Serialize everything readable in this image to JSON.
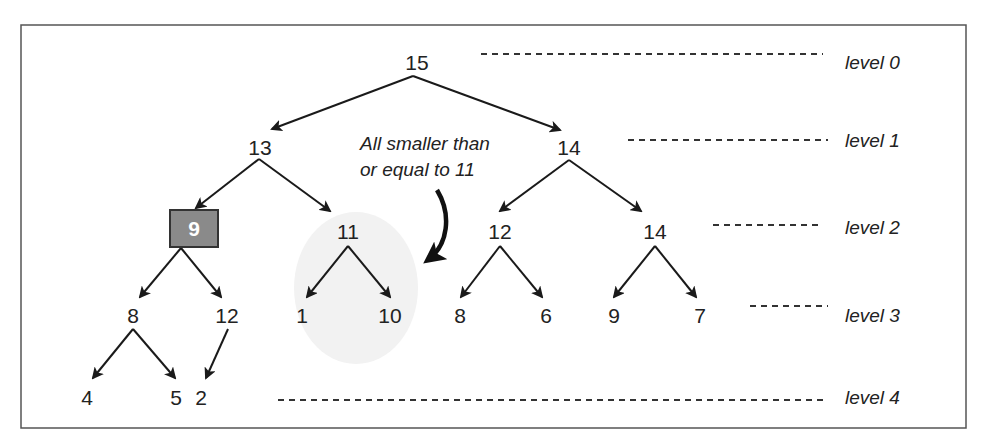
{
  "diagram": {
    "type": "max-heap-tree",
    "frame": {
      "x": 21,
      "y": 25,
      "w": 945,
      "h": 403,
      "border": "#555555"
    },
    "colors": {
      "edge": "#1a1a1a",
      "highlight_fill": "#8a8a8a",
      "highlight_border": "#333333",
      "highlight_text": "#ffffff",
      "cloud": "#f2f2f2"
    },
    "nodes": [
      {
        "id": "n15",
        "label": "15",
        "x": 417,
        "y": 62,
        "level": 0
      },
      {
        "id": "n13",
        "label": "13",
        "x": 260,
        "y": 147,
        "level": 1
      },
      {
        "id": "n14a",
        "label": "14",
        "x": 569,
        "y": 147,
        "level": 1
      },
      {
        "id": "n9",
        "label": "9",
        "x": 194,
        "y": 228,
        "level": 2,
        "highlighted": true
      },
      {
        "id": "n11",
        "label": "11",
        "x": 348,
        "y": 231,
        "level": 2
      },
      {
        "id": "n12a",
        "label": "12",
        "x": 500,
        "y": 231,
        "level": 2
      },
      {
        "id": "n14b",
        "label": "14",
        "x": 655,
        "y": 231,
        "level": 2
      },
      {
        "id": "n8a",
        "label": "8",
        "x": 133,
        "y": 315,
        "level": 3
      },
      {
        "id": "n12b",
        "label": "12",
        "x": 227,
        "y": 315,
        "level": 3
      },
      {
        "id": "n1",
        "label": "1",
        "x": 302,
        "y": 315,
        "level": 3
      },
      {
        "id": "n10",
        "label": "10",
        "x": 390,
        "y": 315,
        "level": 3
      },
      {
        "id": "n8b",
        "label": "8",
        "x": 460,
        "y": 315,
        "level": 3
      },
      {
        "id": "n6",
        "label": "6",
        "x": 546,
        "y": 315,
        "level": 3
      },
      {
        "id": "n9b",
        "label": "9",
        "x": 614,
        "y": 315,
        "level": 3
      },
      {
        "id": "n7",
        "label": "7",
        "x": 700,
        "y": 315,
        "level": 3
      },
      {
        "id": "n4",
        "label": "4",
        "x": 87,
        "y": 397,
        "level": 4
      },
      {
        "id": "n5",
        "label": "5",
        "x": 176,
        "y": 397,
        "level": 4
      },
      {
        "id": "n2",
        "label": "2",
        "x": 201,
        "y": 397,
        "level": 4
      }
    ],
    "edges": [
      {
        "from": "n15",
        "to": "n13",
        "x1": 413,
        "y1": 76,
        "x2": 272,
        "y2": 129
      },
      {
        "from": "n15",
        "to": "n14a",
        "x1": 413,
        "y1": 76,
        "x2": 560,
        "y2": 130
      },
      {
        "from": "n13",
        "to": "n9",
        "x1": 259,
        "y1": 159,
        "x2": 196,
        "y2": 208
      },
      {
        "from": "n13",
        "to": "n11",
        "x1": 259,
        "y1": 159,
        "x2": 330,
        "y2": 211
      },
      {
        "from": "n14a",
        "to": "n12a",
        "x1": 569,
        "y1": 160,
        "x2": 500,
        "y2": 211
      },
      {
        "from": "n14a",
        "to": "n14b",
        "x1": 569,
        "y1": 160,
        "x2": 641,
        "y2": 211
      },
      {
        "from": "n9",
        "to": "n8a",
        "x1": 181,
        "y1": 248,
        "x2": 140,
        "y2": 297
      },
      {
        "from": "n9",
        "to": "n12b",
        "x1": 181,
        "y1": 248,
        "x2": 221,
        "y2": 297
      },
      {
        "from": "n11",
        "to": "n1",
        "x1": 348,
        "y1": 246,
        "x2": 307,
        "y2": 297
      },
      {
        "from": "n11",
        "to": "n10",
        "x1": 348,
        "y1": 246,
        "x2": 390,
        "y2": 297
      },
      {
        "from": "n12a",
        "to": "n8b",
        "x1": 500,
        "y1": 246,
        "x2": 461,
        "y2": 297
      },
      {
        "from": "n12a",
        "to": "n6",
        "x1": 500,
        "y1": 246,
        "x2": 542,
        "y2": 297
      },
      {
        "from": "n14b",
        "to": "n9b",
        "x1": 655,
        "y1": 246,
        "x2": 614,
        "y2": 297
      },
      {
        "from": "n14b",
        "to": "n7",
        "x1": 655,
        "y1": 246,
        "x2": 696,
        "y2": 297
      },
      {
        "from": "n8a",
        "to": "n4",
        "x1": 133,
        "y1": 329,
        "x2": 93,
        "y2": 378
      },
      {
        "from": "n8a",
        "to": "n5",
        "x1": 133,
        "y1": 329,
        "x2": 175,
        "y2": 378
      },
      {
        "from": "n12b",
        "to": "n2",
        "x1": 228,
        "y1": 329,
        "x2": 206,
        "y2": 378
      }
    ],
    "levels": [
      {
        "label": "level 0",
        "x": 845,
        "y": 62,
        "dash_x1": 481,
        "dash_x2": 823,
        "dash_y": 54
      },
      {
        "label": "level 1",
        "x": 845,
        "y": 140,
        "dash_x1": 628,
        "dash_x2": 828,
        "dash_y": 140
      },
      {
        "label": "level 2",
        "x": 845,
        "y": 227,
        "dash_x1": 713,
        "dash_x2": 820,
        "dash_y": 225
      },
      {
        "label": "level 3",
        "x": 845,
        "y": 315,
        "dash_x1": 750,
        "dash_x2": 828,
        "dash_y": 306
      },
      {
        "label": "level 4",
        "x": 845,
        "y": 397,
        "dash_x1": 278,
        "dash_x2": 828,
        "dash_y": 400
      }
    ],
    "annotation": {
      "lines": [
        "All smaller than",
        "or equal to 11"
      ],
      "x": 360,
      "y1": 150,
      "y2": 176,
      "arrow_path": "M 437 190 C 452 215, 448 245, 428 260"
    },
    "cloud": {
      "cx": 356,
      "cy": 288,
      "rx": 62,
      "ry": 76
    }
  }
}
